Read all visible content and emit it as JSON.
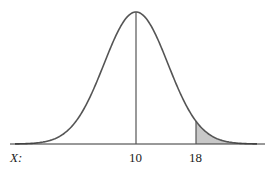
{
  "chart_data": {
    "type": "area",
    "title": "",
    "mean": 10,
    "marked_value": 18,
    "shaded_region": "X > 18",
    "x_axis_label": "X:",
    "tick_labels": [
      "10",
      "18"
    ],
    "xlabel": "X",
    "ylabel": "",
    "grid": false,
    "legend": "none"
  },
  "labels": {
    "axis": "X:",
    "mean": "10",
    "value": "18"
  },
  "colors": {
    "curve": "#555555",
    "shade": "#c8c8c8",
    "axis": "#333333"
  }
}
